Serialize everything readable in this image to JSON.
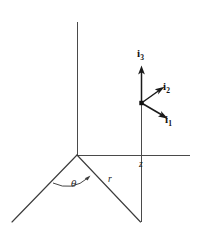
{
  "figure": {
    "background_color": "#ffffff",
    "line_color": "#3c3c3c",
    "vector_color": "#1a1a1a",
    "width": 197,
    "height": 227,
    "labels": {
      "i3": "i",
      "i3_sub": "3",
      "i2": "i",
      "i2_sub": "2",
      "i1": "i",
      "i1_sub": "1",
      "z": "z",
      "r": "r",
      "theta": "θ"
    },
    "geometry": {
      "origin": [
        77,
        155
      ],
      "vertical_axis": [
        [
          77,
          22
        ],
        [
          77,
          155
        ]
      ],
      "horizontal_axis": [
        [
          77,
          155
        ],
        [
          190,
          155
        ]
      ],
      "left_ray": [
        [
          77,
          155
        ],
        [
          12,
          222
        ]
      ],
      "r_ray": [
        [
          77,
          155
        ],
        [
          141,
          222
        ]
      ],
      "drop_line": [
        [
          141,
          155
        ],
        [
          141,
          222
        ]
      ],
      "point_vertical": [
        [
          141,
          103
        ],
        [
          141,
          155
        ]
      ],
      "vector_origin": [
        141,
        103
      ],
      "vector_i3_tip": [
        141,
        66
      ],
      "vector_i2_tip": [
        164,
        87
      ],
      "vector_i1_tip": [
        168,
        119
      ],
      "theta_arc": [
        [
          53,
          183
        ],
        [
          90,
          176
        ]
      ]
    }
  }
}
